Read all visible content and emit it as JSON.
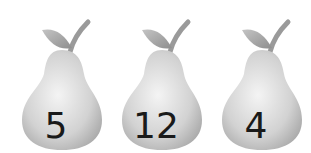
{
  "pears": [
    {
      "number": "5"
    },
    {
      "number": "12"
    },
    {
      "number": "4"
    }
  ],
  "colors": {
    "pear_body_light": "#f2f2f2",
    "pear_body_mid": "#c8c8c8",
    "pear_body_dark": "#9a9a9a",
    "leaf": "#a8a8a8",
    "stem": "#9a9a9a",
    "number": "#1a1a1a"
  }
}
